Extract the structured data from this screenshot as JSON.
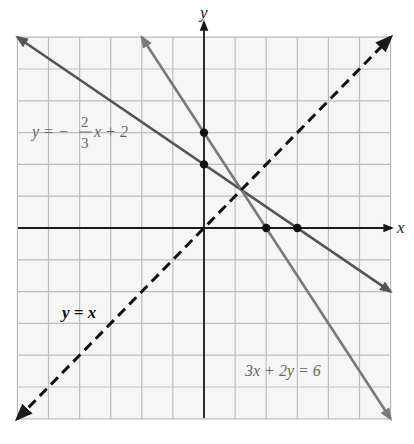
{
  "chart_data": {
    "type": "line",
    "title": "",
    "xlabel": "x",
    "ylabel": "y",
    "xlim": [
      -6,
      6
    ],
    "ylim": [
      -6,
      6
    ],
    "grid": true,
    "grid_step": 1,
    "tick_labels_shown": false,
    "series": [
      {
        "name": "y = -2/3x + 2",
        "label": "y = −(2/3)x + 2",
        "style": "solid",
        "color": "#555555",
        "slope": -0.6667,
        "intercept": 2,
        "x": [
          -6,
          6
        ],
        "y": [
          6,
          -2
        ],
        "marked_points": [
          [
            0,
            2
          ],
          [
            3,
            0
          ]
        ]
      },
      {
        "name": "3x + 2y = 6",
        "label": "3x + 2y = 6",
        "style": "solid",
        "color": "#7a7a7a",
        "slope": -1.5,
        "intercept": 3,
        "x": [
          -2,
          6
        ],
        "y": [
          6,
          -6
        ],
        "marked_points": [
          [
            0,
            3
          ],
          [
            2,
            0
          ]
        ]
      },
      {
        "name": "y = x",
        "label": "y = x",
        "style": "dashed",
        "color": "#111111",
        "slope": 1,
        "intercept": 0,
        "x": [
          -6,
          6
        ],
        "y": [
          -6,
          6
        ]
      }
    ],
    "annotations": [
      {
        "text": "y = −(2/3)x + 2",
        "near": [
          -4.5,
          2.5
        ]
      },
      {
        "text": "y = x",
        "near": [
          -4.5,
          -2.7
        ]
      },
      {
        "text": "3x + 2y = 6",
        "near": [
          3.3,
          -4.5
        ]
      }
    ],
    "common_intersection": [
      1.2,
      1.2
    ]
  },
  "labels": {
    "x_axis": "x",
    "y_axis": "y",
    "line1_lhs": "y = −",
    "line1_num": "2",
    "line1_den": "3",
    "line1_rhs": "x + 2",
    "line2": "3x + 2y = 6",
    "line3": "y = x"
  },
  "colors": {
    "grid": "#bdbdbd",
    "plot_bg": "#f6f6f6",
    "axis": "#1a1a1a"
  }
}
